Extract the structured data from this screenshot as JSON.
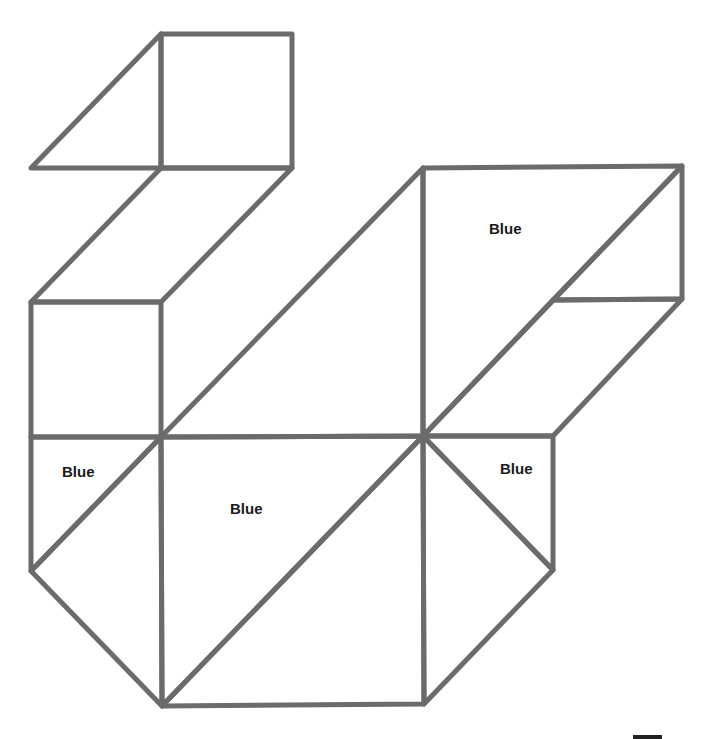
{
  "diagram": {
    "type": "tangram-style geometric outline",
    "stroke_color": "#6b6b6b",
    "stroke_width": 5,
    "labels": [
      {
        "id": "top-right-region",
        "text": "Blue",
        "x": 489,
        "y": 220
      },
      {
        "id": "left-small-triangle",
        "text": "Blue",
        "x": 62,
        "y": 463
      },
      {
        "id": "center-region",
        "text": "Blue",
        "x": 230,
        "y": 500
      },
      {
        "id": "right-small-triangle",
        "text": "Blue",
        "x": 500,
        "y": 460
      }
    ]
  }
}
